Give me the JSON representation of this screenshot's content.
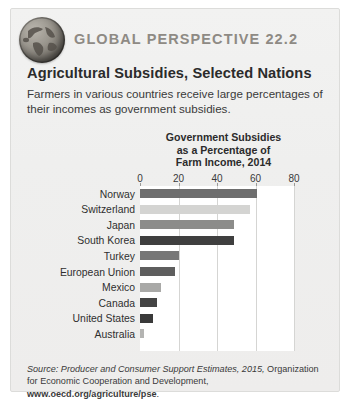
{
  "header": {
    "kicker": "GLOBAL PERSPECTIVE 22.2",
    "title": "Agricultural Subsidies, Selected Nations",
    "deck": "Farmers in various countries receive large percentages of their incomes as government subsidies.",
    "globe_icon": "globe-icon"
  },
  "source": {
    "italic_part": "Source: Producer and Consumer Support Estimates, 2015,",
    "plain_part": " Organization for Economic Cooperation and Development, ",
    "bold_part": "www.oecd.org/agriculture/pse",
    "end": "."
  },
  "colors": {
    "panel_bg": "#efefee",
    "panel_border": "#dcdcda",
    "plot_bg": "#ffffff",
    "grid": "#d5d5d3",
    "kicker": "#8e8a84",
    "text": "#2b2b2b"
  },
  "chart_data": {
    "type": "bar",
    "orientation": "horizontal",
    "title": "Government Subsidies as a Percentage of Farm Income, 2014",
    "title_lines": [
      "Government Subsidies",
      "as a Percentage of",
      "Farm Income, 2014"
    ],
    "xlabel": "",
    "ylabel": "",
    "xlim": [
      0,
      80
    ],
    "ticks": [
      0,
      20,
      40,
      60,
      80
    ],
    "tick_labels": [
      "0",
      "20",
      "40",
      "60",
      "80"
    ],
    "grid": true,
    "legend": "none",
    "categories": [
      "Norway",
      "Switzerland",
      "Japan",
      "South Korea",
      "Turkey",
      "European Union",
      "Mexico",
      "Canada",
      "United States",
      "Australia"
    ],
    "values": [
      61,
      57,
      49,
      49,
      20,
      18,
      11,
      9,
      7,
      2
    ],
    "bar_colors": [
      "#6e6e6e",
      "#d4d4d2",
      "#8c8c8a",
      "#3f3f3f",
      "#777777",
      "#5e5e5e",
      "#a9a9a7",
      "#444444",
      "#3a3a3a",
      "#b4b4b2"
    ]
  }
}
